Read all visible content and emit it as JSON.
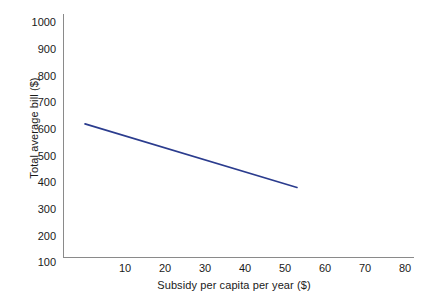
{
  "chart_data": {
    "type": "line",
    "title": "",
    "subtitle": "",
    "xlabel": "Subsidy per capita per year ($)",
    "ylabel": "Total average bill ($)",
    "xlim": [
      0,
      80
    ],
    "ylim": [
      100,
      1000
    ],
    "x_ticks": [
      10,
      20,
      30,
      40,
      50,
      60,
      70,
      80
    ],
    "y_ticks": [
      100,
      200,
      300,
      400,
      500,
      600,
      700,
      800,
      900,
      1000
    ],
    "grid": false,
    "legend": false,
    "legend_position": "none",
    "series": [
      {
        "name": "Total average bill",
        "color": "#2b3c8e",
        "x": [
          0,
          53
        ],
        "values": [
          600,
          362
        ]
      }
    ],
    "annotations": []
  },
  "axis_style": {
    "axis_color": "#8a8a8a",
    "label_color": "#1a1a1a",
    "background": "#ffffff"
  }
}
